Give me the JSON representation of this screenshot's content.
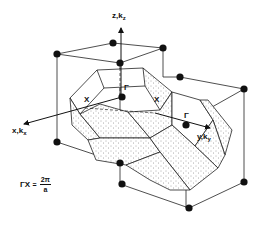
{
  "figure": {
    "colors": {
      "line": "#222222",
      "dot": "#111111",
      "stipple": "#555555",
      "background": "#ffffff"
    },
    "axes": {
      "z": {
        "label": "z,k",
        "sub": "z"
      },
      "x": {
        "label": "x,k",
        "sub": "x"
      },
      "y": {
        "label": "y,k",
        "sub": "y"
      }
    },
    "points": {
      "gamma_left": "Γ",
      "gamma_right": "Γ",
      "x_left": "X",
      "x_right": "X"
    },
    "formula": {
      "lhs": "ΓX",
      "eq": "=",
      "numerator": "2π",
      "denominator": "a"
    }
  }
}
